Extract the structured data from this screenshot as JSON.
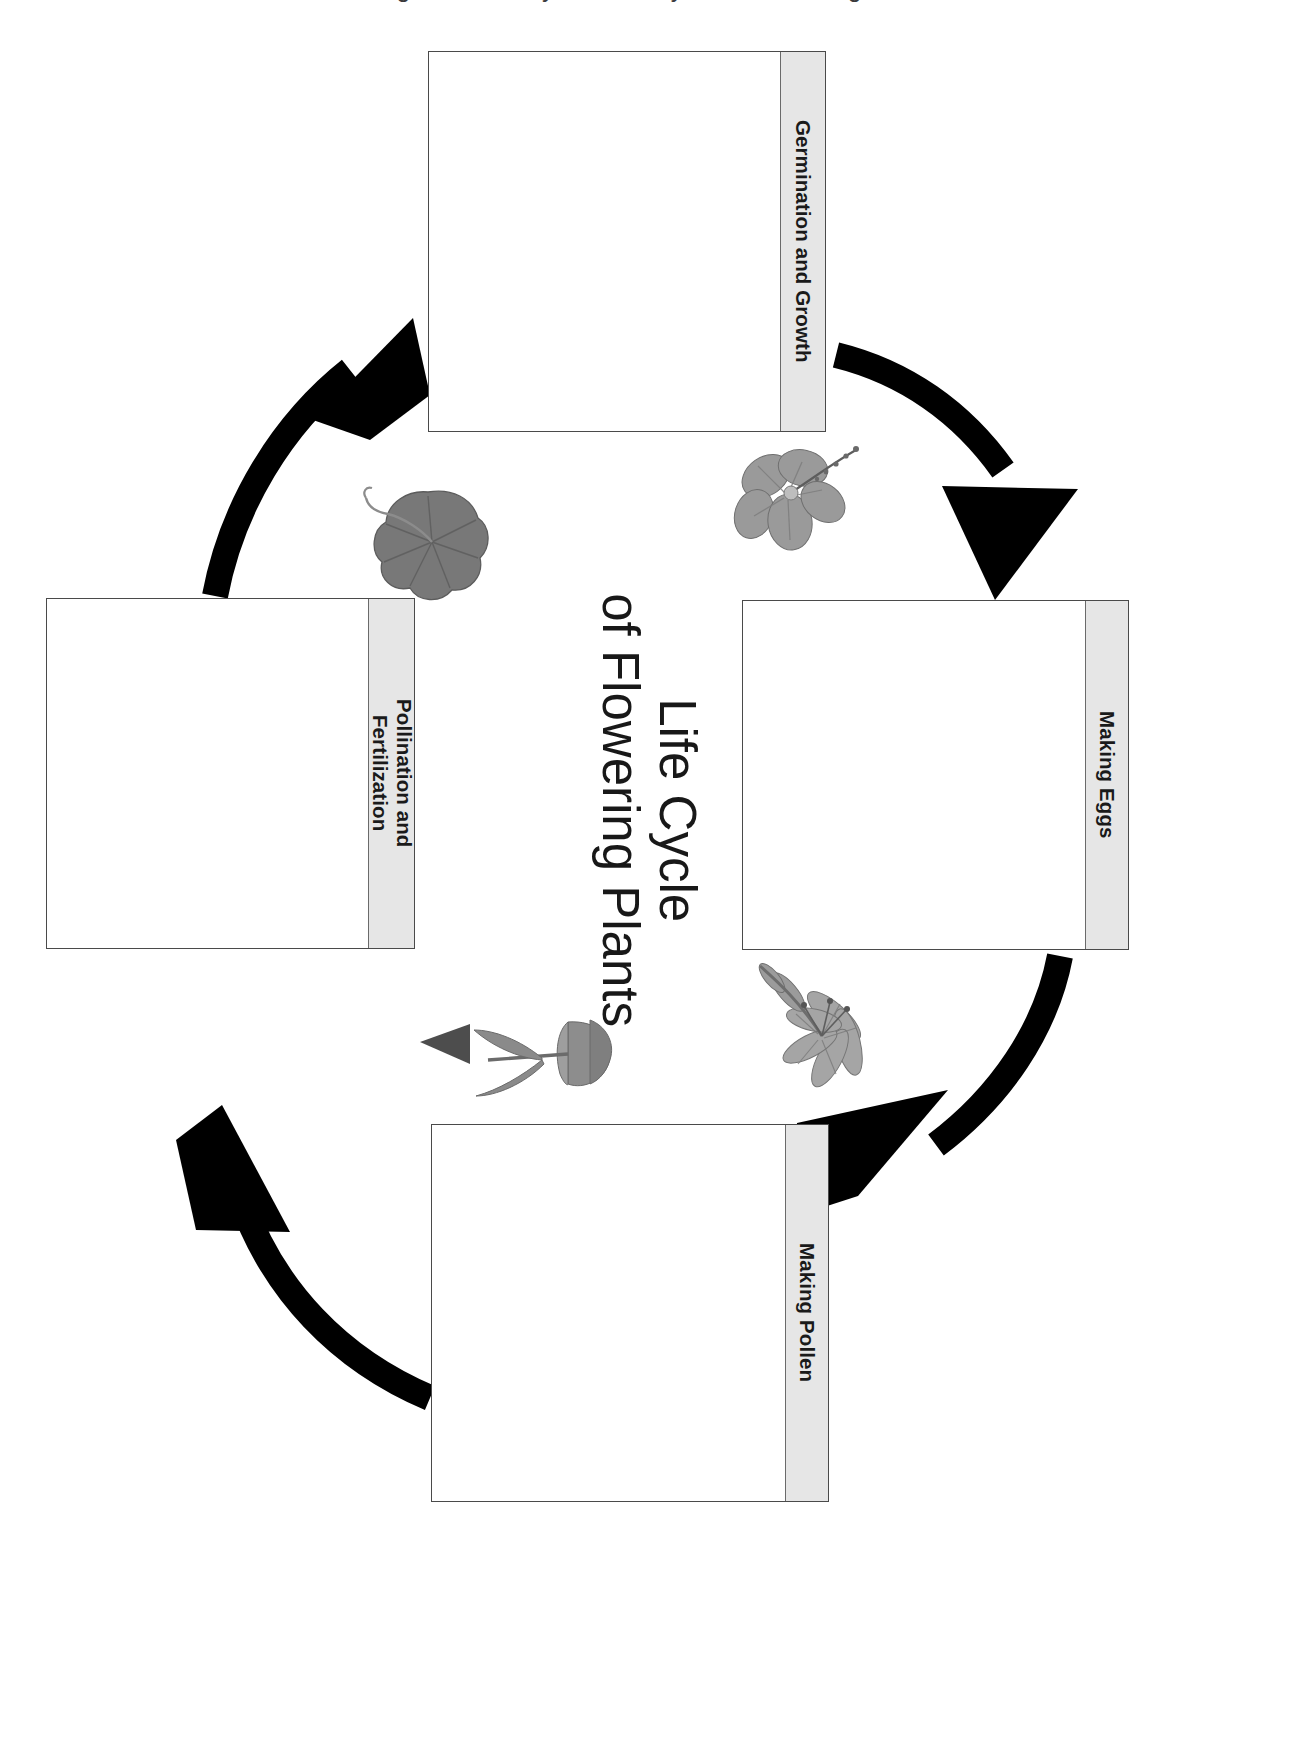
{
  "poster": {
    "title_line1": "Life Cycle",
    "title_line2": "of Flowering Plants",
    "top_cutoff_text": "Diagram to Study the Life Cycle of Flowering Plants",
    "orientation_note": "rotated 90 degrees",
    "background_color": "#ffffff",
    "label_strip_color": "#e6e6e6",
    "outline_color": "#4a4a4a",
    "arrow_color": "#000000"
  },
  "stages": [
    {
      "id": "germination",
      "label": "Germination and Growth",
      "position": "top",
      "order": 1
    },
    {
      "id": "making-eggs",
      "label": "Making Eggs",
      "position": "right",
      "order": 2
    },
    {
      "id": "making-pollen",
      "label": "Making Pollen",
      "position": "bottom",
      "order": 3
    },
    {
      "id": "pollination-fertilization",
      "label": "Pollination and\nFertilization",
      "position": "left",
      "order": 4
    }
  ],
  "arrows": [
    {
      "id": "arrow-germination-to-eggs",
      "from": "germination",
      "to": "making-eggs"
    },
    {
      "id": "arrow-eggs-to-pollen",
      "from": "making-eggs",
      "to": "making-pollen"
    },
    {
      "id": "arrow-pollen-to-pollination",
      "from": "making-pollen",
      "to": "pollination-fertilization"
    },
    {
      "id": "arrow-pollination-to-germination",
      "from": "pollination-fertilization",
      "to": "germination"
    }
  ],
  "photos": [
    {
      "id": "hibiscus-flower-photo",
      "subject": "hibiscus flower",
      "near_stage": "germination"
    },
    {
      "id": "lily-flower-photo",
      "subject": "lily flower",
      "near_stage": "making-eggs"
    },
    {
      "id": "tulip-flower-photo",
      "subject": "tulip flower",
      "near_stage": "making-pollen"
    },
    {
      "id": "leaf-photo",
      "subject": "green leaf",
      "near_stage": "pollination-fertilization"
    }
  ]
}
